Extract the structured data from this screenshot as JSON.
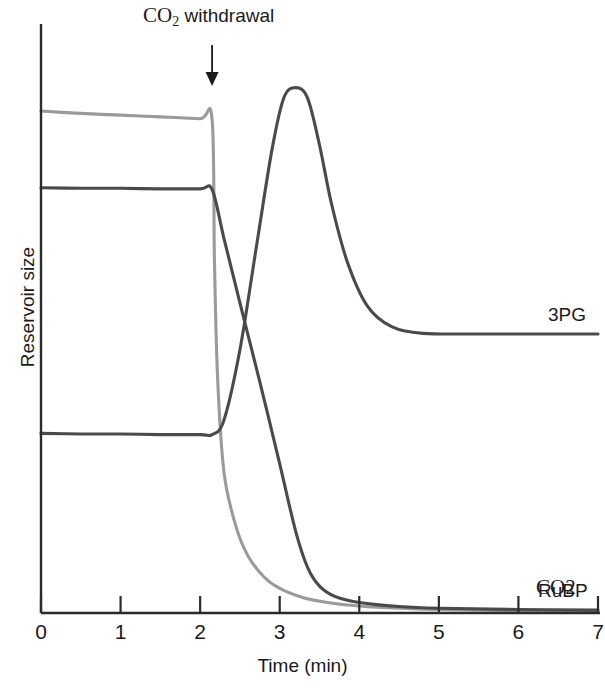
{
  "annotation": {
    "text_prefix": "CO",
    "text_sub": "2",
    "text_suffix": " withdrawal",
    "arrow_x_value": 2.15
  },
  "axes": {
    "x_title": "Time (min)",
    "y_title": "Reservoir size",
    "x_ticks": [
      "0",
      "1",
      "2",
      "3",
      "4",
      "5",
      "6",
      "7"
    ]
  },
  "colors": {
    "axis": "#2b2b2b",
    "dark_curve": "#4a4a4a",
    "light_curve": "#9a9a9a",
    "text": "#1a1a1a"
  },
  "labels": {
    "rubp": "RuBP",
    "pg3": "3PG",
    "co2": "CO2"
  },
  "chart_data": {
    "type": "line",
    "title": "CO2 withdrawal",
    "xlabel": "Time (min)",
    "ylabel": "Reservoir size",
    "xlim": [
      0,
      7
    ],
    "ylim": [
      0,
      1
    ],
    "grid": false,
    "legend_position": "right-end-of-line",
    "annotations": [
      {
        "text": "CO2 withdrawal",
        "x": 2.15,
        "type": "arrow-down"
      }
    ],
    "series": [
      {
        "name": "CO2",
        "color": "#9a9a9a",
        "points": [
          [
            0.0,
            0.858
          ],
          [
            0.5,
            0.854
          ],
          [
            1.0,
            0.851
          ],
          [
            1.5,
            0.848
          ],
          [
            2.0,
            0.845
          ],
          [
            2.15,
            0.844
          ],
          [
            2.18,
            0.6
          ],
          [
            2.22,
            0.4
          ],
          [
            2.3,
            0.24
          ],
          [
            2.45,
            0.148
          ],
          [
            2.6,
            0.098
          ],
          [
            2.8,
            0.062
          ],
          [
            3.0,
            0.042
          ],
          [
            3.3,
            0.026
          ],
          [
            3.6,
            0.018
          ],
          [
            4.0,
            0.012
          ],
          [
            4.5,
            0.008
          ],
          [
            5.0,
            0.006
          ],
          [
            6.0,
            0.004
          ],
          [
            7.0,
            0.003
          ]
        ]
      },
      {
        "name": "RuBP",
        "color": "#4a4a4a",
        "points": [
          [
            0.0,
            0.727
          ],
          [
            0.5,
            0.726
          ],
          [
            1.0,
            0.726
          ],
          [
            1.5,
            0.725
          ],
          [
            2.0,
            0.725
          ],
          [
            2.15,
            0.724
          ],
          [
            2.3,
            0.64
          ],
          [
            2.5,
            0.53
          ],
          [
            2.75,
            0.395
          ],
          [
            3.0,
            0.255
          ],
          [
            3.2,
            0.14
          ],
          [
            3.35,
            0.078
          ],
          [
            3.5,
            0.046
          ],
          [
            3.7,
            0.028
          ],
          [
            4.0,
            0.018
          ],
          [
            4.5,
            0.011
          ],
          [
            5.0,
            0.008
          ],
          [
            6.0,
            0.006
          ],
          [
            7.0,
            0.005
          ]
        ]
      },
      {
        "name": "3PG",
        "color": "#4a4a4a",
        "points": [
          [
            0.0,
            0.307
          ],
          [
            0.5,
            0.306
          ],
          [
            1.0,
            0.306
          ],
          [
            1.5,
            0.305
          ],
          [
            2.0,
            0.305
          ],
          [
            2.15,
            0.305
          ],
          [
            2.3,
            0.33
          ],
          [
            2.5,
            0.45
          ],
          [
            2.7,
            0.62
          ],
          [
            2.9,
            0.79
          ],
          [
            3.05,
            0.88
          ],
          [
            3.2,
            0.898
          ],
          [
            3.35,
            0.88
          ],
          [
            3.5,
            0.8
          ],
          [
            3.65,
            0.7
          ],
          [
            3.85,
            0.6
          ],
          [
            4.1,
            0.525
          ],
          [
            4.4,
            0.49
          ],
          [
            4.8,
            0.478
          ],
          [
            5.5,
            0.477
          ],
          [
            6.2,
            0.477
          ],
          [
            7.0,
            0.477
          ]
        ]
      }
    ]
  }
}
